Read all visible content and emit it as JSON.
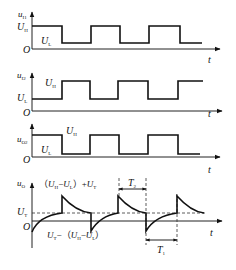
{
  "panels": [
    {
      "id": "u_i1",
      "y_label": "u",
      "y_label_sub": "I1",
      "level_high_label": "U",
      "level_high_sub": "H",
      "level_low_label": "U",
      "level_low_sub": "L",
      "x_label": "t",
      "origin": "O"
    },
    {
      "id": "u_i2",
      "y_label": "u",
      "y_label_sub": "I2",
      "level_high_label": "U",
      "level_high_sub": "H",
      "level_low_label": "U",
      "level_low_sub": "L",
      "x_label": "t",
      "origin": "O"
    },
    {
      "id": "u_o2",
      "y_label": "u",
      "y_label_sub": "O2",
      "level_high_label": "U",
      "level_high_sub": "H",
      "level_low_label": "U",
      "level_low_sub": "L",
      "x_label": "t",
      "origin": "O"
    },
    {
      "id": "u_o",
      "y_label": "u",
      "y_label_sub": "O",
      "threshold_label": "U",
      "threshold_sub": "T",
      "upper_annotation": "（U_H−U_L）+U_T",
      "lower_annotation": "U_T−（U_H−U_L）",
      "period_T1": "T",
      "period_T1_sub": "1",
      "period_T2": "T",
      "period_T2_sub": "2",
      "x_label": "t",
      "origin": "O"
    }
  ],
  "annotations": {
    "upper_open": "（",
    "upper_U1": "U",
    "upper_U1_sub": "H",
    "upper_minus": "−",
    "upper_U2": "U",
    "upper_U2_sub": "L",
    "upper_close_plus": "）+",
    "upper_U3": "U",
    "upper_U3_sub": "T",
    "lower_U1": "U",
    "lower_U1_sub": "T",
    "lower_minus_open": "−（",
    "lower_U2": "U",
    "lower_U2_sub": "H",
    "lower_minus": "−",
    "lower_U3": "U",
    "lower_U3_sub": "L",
    "lower_close": "）"
  },
  "colors": {
    "stroke": "#111111",
    "background": "#ffffff"
  }
}
